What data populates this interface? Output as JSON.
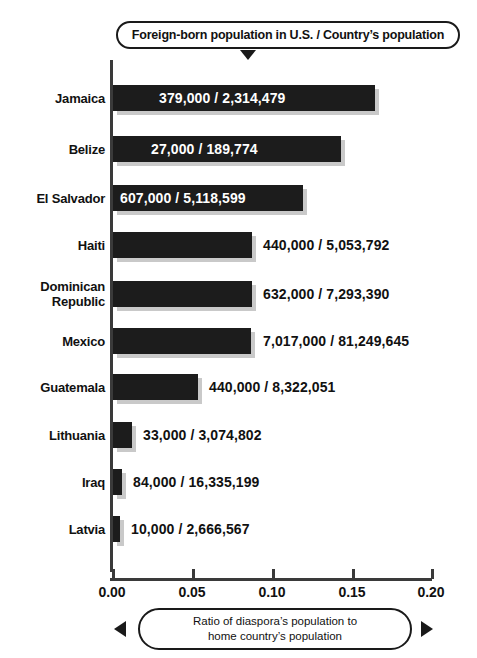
{
  "legend": {
    "text": "Foreign-born population in U.S. / Country’s population",
    "pointer_icon": "triangle-down-icon"
  },
  "caption": {
    "line1": "Ratio of diaspora’s population to",
    "line2": "home country’s population",
    "arrow_left_icon": "triangle-left-icon",
    "arrow_right_icon": "triangle-right-icon"
  },
  "colors": {
    "bar": "#1c1c1c",
    "bar_shadow": "#c9c9c9",
    "axis": "#3a3a3a",
    "text": "#111111",
    "background": "#ffffff",
    "inside_label": "#ffffff"
  },
  "chart_data": {
    "type": "bar",
    "orientation": "horizontal",
    "title": "Foreign-born population in U.S. / Country’s population",
    "xlabel": "Ratio of diaspora’s population to home country’s population",
    "ylabel": "",
    "xlim": [
      0.0,
      0.2
    ],
    "xticks": [
      "0.00",
      "0.05",
      "0.10",
      "0.15",
      "0.20"
    ],
    "xtick_values": [
      0.0,
      0.05,
      0.1,
      0.15,
      0.2
    ],
    "grid": false,
    "legend": "none",
    "categories": [
      "Jamaica",
      "Belize",
      "El Salvador",
      "Haiti",
      "Dominican\nRepublic",
      "Mexico",
      "Guatemala",
      "Lithuania",
      "Iraq",
      "Latvia"
    ],
    "values": [
      0.1637,
      0.1423,
      0.1186,
      0.0871,
      0.0867,
      0.0864,
      0.0529,
      0.0107,
      0.0051,
      0.0038
    ],
    "annotations": [
      "379,000 / 2,314,479",
      "27,000 / 189,774",
      "607,000 / 5,118,599",
      "440,000 / 5,053,792",
      "632,000 / 7,293,390",
      "7,017,000 / 81,249,645",
      "440,000 / 8,322,051",
      "33,000 / 3,074,802",
      "84,000 / 16,335,199",
      "10,000 / 2,666,567"
    ]
  },
  "rows": [
    {
      "label": "Jamaica",
      "value_text": "379,000 / 2,314,479",
      "ratio": 0.1637,
      "bar_px": 262,
      "top_px": 27,
      "label_inside": true,
      "value_offset_px": 46
    },
    {
      "label": "Belize",
      "value_text": "27,000 / 189,774",
      "ratio": 0.1423,
      "bar_px": 228,
      "top_px": 78,
      "label_inside": true,
      "value_offset_px": 38
    },
    {
      "label": "El Salvador",
      "value_text": "607,000 / 5,118,599",
      "ratio": 0.1186,
      "bar_px": 190,
      "top_px": 127,
      "label_inside": true,
      "value_offset_px": 7
    },
    {
      "label": "Haiti",
      "value_text": "440,000 / 5,053,792",
      "ratio": 0.0871,
      "bar_px": 139,
      "top_px": 174,
      "label_inside": false,
      "value_offset_px": 150
    },
    {
      "label": "Dominican\nRepublic",
      "value_text": "632,000 / 7,293,390",
      "ratio": 0.0867,
      "bar_px": 139,
      "top_px": 223,
      "label_inside": false,
      "value_offset_px": 150
    },
    {
      "label": "Mexico",
      "value_text": "7,017,000 / 81,249,645",
      "ratio": 0.0864,
      "bar_px": 138,
      "top_px": 270,
      "label_inside": false,
      "value_offset_px": 150
    },
    {
      "label": "Guatemala",
      "value_text": "440,000 / 8,322,051",
      "ratio": 0.0529,
      "bar_px": 85,
      "top_px": 316,
      "label_inside": false,
      "value_offset_px": 96
    },
    {
      "label": "Lithuania",
      "value_text": "33,000 / 3,074,802",
      "ratio": 0.0107,
      "bar_px": 19,
      "top_px": 364,
      "label_inside": false,
      "value_offset_px": 30
    },
    {
      "label": "Iraq",
      "value_text": "84,000 / 16,335,199",
      "ratio": 0.0051,
      "bar_px": 9,
      "top_px": 411,
      "label_inside": false,
      "value_offset_px": 20
    },
    {
      "label": "Latvia",
      "value_text": "10,000 / 2,666,567",
      "ratio": 0.0038,
      "bar_px": 7,
      "top_px": 458,
      "label_inside": false,
      "value_offset_px": 18
    }
  ],
  "axis": {
    "ticks": [
      {
        "label": "0.00",
        "x_px": 112
      },
      {
        "label": "0.05",
        "x_px": 192
      },
      {
        "label": "0.10",
        "x_px": 272
      },
      {
        "label": "0.15",
        "x_px": 352
      },
      {
        "label": "0.20",
        "x_px": 431
      }
    ]
  }
}
